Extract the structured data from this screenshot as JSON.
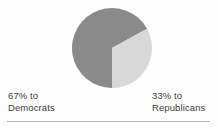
{
  "chart_data": {
    "type": "pie",
    "title": "",
    "categories": [
      "Democrats",
      "Republicans"
    ],
    "values": [
      67,
      33
    ],
    "unit": "percent",
    "slices": [
      {
        "label": "Democrats",
        "value": 67,
        "percent_text": "67%",
        "prefix_text": "67% to",
        "color": "#8a8a8a",
        "start_angle_deg": 180,
        "end_angle_deg": 421.2
      },
      {
        "label": "Republicans",
        "value": 33,
        "percent_text": "33%",
        "prefix_text": "33% to",
        "color": "#d8d8d8",
        "start_angle_deg": 61.2,
        "end_angle_deg": 180
      }
    ],
    "legend_position": "below-slices",
    "grid": false,
    "xlabel": "",
    "ylabel": ""
  },
  "figure": {
    "background_color": "#fdfdfd",
    "pie": {
      "center_x": 112,
      "center_y": 48,
      "radius": 40,
      "stroke_color": "#ffffff",
      "stroke_width": 0
    },
    "labels": {
      "left": {
        "line1": "67% to",
        "line2": "Democrats",
        "color": "#3d3d3d"
      },
      "right": {
        "line1": "33% to",
        "line2": "Republicans",
        "color": "#3d3d3d"
      }
    },
    "rule": {
      "color": "#b9b9b9"
    }
  }
}
